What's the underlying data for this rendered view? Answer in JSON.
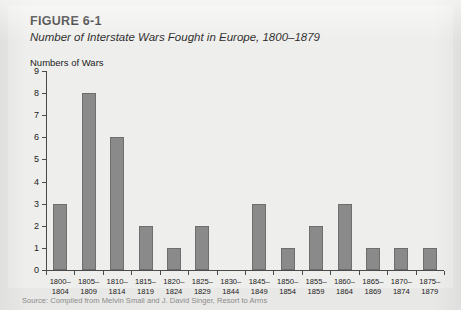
{
  "figure": {
    "label": "FIGURE 6-1",
    "title": "Number of Interstate Wars Fought in Europe, 1800–1879",
    "axis_title": "Numbers of Wars",
    "source_note": "Source: Compiled from Melvin Small and J. David Singer, Resort to Arms"
  },
  "colors": {
    "panel_background": "#eeeeec",
    "page_background": "#e8e8e6",
    "bar_fill": "#8a8a8a",
    "bar_stroke": "#6e6e6e",
    "axis": "#4a4a4a",
    "text": "#1b1b1b"
  },
  "chart_data": {
    "type": "bar",
    "title": "Number of Interstate Wars Fought in Europe, 1800–1879",
    "xlabel": "",
    "ylabel": "Numbers of Wars",
    "ylim": [
      0,
      9
    ],
    "yticks": [
      0,
      1,
      2,
      3,
      4,
      5,
      6,
      7,
      8,
      9
    ],
    "grid": false,
    "legend": "none",
    "categories": [
      "1800–\n1804",
      "1805–\n1809",
      "1810–\n1814",
      "1815–\n1819",
      "1820–\n1824",
      "1825–\n1829",
      "1830–\n1844",
      "1845–\n1849",
      "1850–\n1854",
      "1855–\n1859",
      "1860–\n1864",
      "1865–\n1869",
      "1870–\n1874",
      "1875–\n1879"
    ],
    "category_lines": [
      [
        "1800–",
        "1804"
      ],
      [
        "1805–",
        "1809"
      ],
      [
        "1810–",
        "1814"
      ],
      [
        "1815–",
        "1819"
      ],
      [
        "1820–",
        "1824"
      ],
      [
        "1825–",
        "1829"
      ],
      [
        "1830–",
        "1844"
      ],
      [
        "1845–",
        "1849"
      ],
      [
        "1850–",
        "1854"
      ],
      [
        "1855–",
        "1859"
      ],
      [
        "1860–",
        "1864"
      ],
      [
        "1865–",
        "1869"
      ],
      [
        "1870–",
        "1874"
      ],
      [
        "1875–",
        "1879"
      ]
    ],
    "values": [
      3,
      8,
      6,
      2,
      1,
      2,
      0,
      3,
      1,
      2,
      3,
      1,
      1,
      1
    ]
  }
}
